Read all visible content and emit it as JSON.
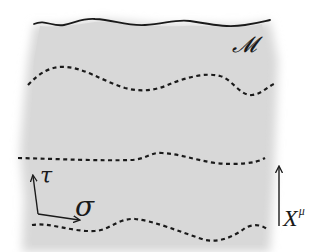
{
  "diagram": {
    "type": "worldsheet",
    "background_color": "#ffffff",
    "region_color": "#d8d8d8",
    "curve_color": "#1a1a1a",
    "labels": {
      "manifold": "𝓜",
      "tau": "τ",
      "sigma": "σ",
      "target_base": "X",
      "target_sup": "μ"
    },
    "curves": [
      {
        "name": "top-boundary",
        "style": "solid"
      },
      {
        "name": "slice-1",
        "style": "dashed"
      },
      {
        "name": "slice-2",
        "style": "dashed"
      },
      {
        "name": "slice-3",
        "style": "dashed"
      }
    ],
    "axes": {
      "tau": "vertical arrow (up)",
      "sigma": "horizontal arrow (right)",
      "target_arrow": "vertical arrow (up), right side"
    }
  }
}
